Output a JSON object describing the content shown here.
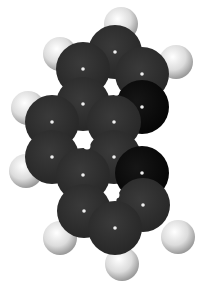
{
  "figure": {
    "background": "#ffffff",
    "colors": {
      "carbon": "#333333",
      "carbon_shadow": "#111111",
      "hydrogen": "#e6e6e6",
      "highlight": "#ffffff"
    },
    "hydrogens": [
      {
        "x": 121,
        "y": 24,
        "r": 17
      },
      {
        "x": 60,
        "y": 54,
        "r": 17
      },
      {
        "x": 176,
        "y": 62,
        "r": 17
      },
      {
        "x": 28,
        "y": 108,
        "r": 17
      },
      {
        "x": 26,
        "y": 171,
        "r": 17
      },
      {
        "x": 60,
        "y": 238,
        "r": 17
      },
      {
        "x": 178,
        "y": 237,
        "r": 17
      },
      {
        "x": 122,
        "y": 264,
        "r": 17
      }
    ],
    "carbons": [
      {
        "x": 115,
        "y": 52,
        "r": 27,
        "shade": "carbon"
      },
      {
        "x": 83,
        "y": 69,
        "r": 27,
        "shade": "carbon"
      },
      {
        "x": 142,
        "y": 74,
        "r": 27,
        "shade": "carbon"
      },
      {
        "x": 83,
        "y": 104,
        "r": 27,
        "shade": "carbon"
      },
      {
        "x": 142,
        "y": 107,
        "r": 27,
        "shade": "carbon_shadow"
      },
      {
        "x": 52,
        "y": 122,
        "r": 27,
        "shade": "carbon"
      },
      {
        "x": 114,
        "y": 122,
        "r": 27,
        "shade": "carbon"
      },
      {
        "x": 52,
        "y": 157,
        "r": 27,
        "shade": "carbon"
      },
      {
        "x": 114,
        "y": 157,
        "r": 27,
        "shade": "carbon"
      },
      {
        "x": 83,
        "y": 175,
        "r": 27,
        "shade": "carbon"
      },
      {
        "x": 142,
        "y": 173,
        "r": 27,
        "shade": "carbon_shadow"
      },
      {
        "x": 84,
        "y": 211,
        "r": 27,
        "shade": "carbon"
      },
      {
        "x": 143,
        "y": 205,
        "r": 27,
        "shade": "carbon"
      },
      {
        "x": 115,
        "y": 228,
        "r": 27,
        "shade": "carbon"
      }
    ],
    "ring_holes": [
      {
        "x": 116,
        "y": 92
      },
      {
        "x": 87,
        "y": 146
      },
      {
        "x": 116,
        "y": 195
      }
    ]
  }
}
